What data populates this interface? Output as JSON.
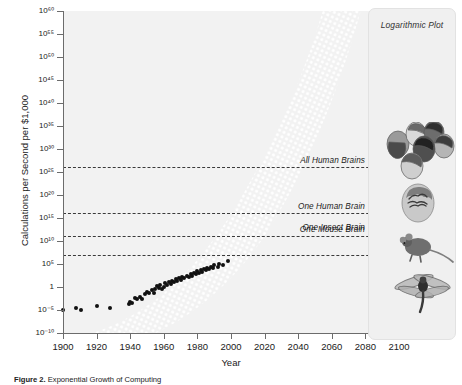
{
  "figure": {
    "panel_title": "Logarithmic Plot",
    "caption_prefix": "Figure 2.",
    "caption_text": " Exponential Growth of Computing",
    "background": "#ffffff",
    "plot_background": "#f2f2f2",
    "point_color": "#111111",
    "ref_line_color": "#3a3a3a"
  },
  "chart_data": {
    "type": "scatter",
    "title": "Logarithmic Plot",
    "xlabel": "Year",
    "ylabel": "Calculations per Second per $1,000",
    "xlim": [
      1900,
      2100
    ],
    "ylim": [
      -10,
      60
    ],
    "y_scale": "log10",
    "grid": false,
    "legend_position": "none",
    "xticks": [
      1900,
      1920,
      1940,
      1960,
      1980,
      2000,
      2020,
      2040,
      2060,
      2080,
      2100
    ],
    "xtick_labels": [
      "1900",
      "1920",
      "1940",
      "1960",
      "1980",
      "2000",
      "2020",
      "2040",
      "2060",
      "2080",
      "2100"
    ],
    "yticks": [
      -10,
      -5,
      0,
      5,
      10,
      15,
      20,
      25,
      30,
      35,
      40,
      45,
      50,
      55,
      60
    ],
    "ytick_labels": [
      "10⁻¹⁰",
      "10⁻⁵",
      "1",
      "10⁵",
      "10¹⁰",
      "10¹⁵",
      "10²⁰",
      "10²⁵",
      "10³⁰",
      "10³⁵",
      "10⁴⁰",
      "10⁴⁵",
      "10⁵⁰",
      "10⁵⁵",
      "10⁶⁰"
    ],
    "reference_lines": [
      {
        "label": "All Human Brains",
        "y_exp": 26,
        "icon": "human-heads-cluster"
      },
      {
        "label": "One Human Brain",
        "y_exp": 16,
        "icon": "human-head-brain"
      },
      {
        "label": "One Mouse Brain",
        "y_exp": 11,
        "icon": "mouse"
      },
      {
        "label": "One Insect Brain",
        "y_exp": 7,
        "icon": "dragonfly"
      }
    ],
    "series": [
      {
        "name": "Computing devices",
        "marker": "filled-circle",
        "color": "#111111",
        "points": [
          [
            1900,
            -5.0
          ],
          [
            1908,
            -4.5
          ],
          [
            1911,
            -4.9
          ],
          [
            1920,
            -4.1
          ],
          [
            1928,
            -4.6
          ],
          [
            1939,
            -3.6
          ],
          [
            1940,
            -3.2
          ],
          [
            1941,
            -3.4
          ],
          [
            1943,
            -2.3
          ],
          [
            1944,
            -2.7
          ],
          [
            1946,
            -2.1
          ],
          [
            1947,
            -2.6
          ],
          [
            1949,
            -1.6
          ],
          [
            1950,
            -1.1
          ],
          [
            1951,
            -1.4
          ],
          [
            1953,
            -0.7
          ],
          [
            1954,
            -1.2
          ],
          [
            1955,
            -0.4
          ],
          [
            1956,
            0.2
          ],
          [
            1957,
            -0.2
          ],
          [
            1958,
            0.5
          ],
          [
            1959,
            -0.5
          ],
          [
            1960,
            0.1
          ],
          [
            1961,
            0.8
          ],
          [
            1962,
            0.4
          ],
          [
            1963,
            1.1
          ],
          [
            1964,
            0.6
          ],
          [
            1965,
            1.4
          ],
          [
            1966,
            1.0
          ],
          [
            1967,
            1.7
          ],
          [
            1968,
            1.3
          ],
          [
            1969,
            2.0
          ],
          [
            1970,
            1.6
          ],
          [
            1971,
            2.2
          ],
          [
            1972,
            1.9
          ],
          [
            1974,
            2.5
          ],
          [
            1975,
            2.2
          ],
          [
            1976,
            2.8
          ],
          [
            1977,
            2.5
          ],
          [
            1978,
            3.1
          ],
          [
            1979,
            2.8
          ],
          [
            1980,
            3.4
          ],
          [
            1981,
            3.1
          ],
          [
            1982,
            3.6
          ],
          [
            1983,
            3.3
          ],
          [
            1984,
            3.9
          ],
          [
            1985,
            3.6
          ],
          [
            1986,
            4.2
          ],
          [
            1987,
            3.9
          ],
          [
            1988,
            4.4
          ],
          [
            1989,
            4.1
          ],
          [
            1990,
            4.7
          ],
          [
            1992,
            4.4
          ],
          [
            1993,
            5.0
          ],
          [
            1995,
            4.8
          ],
          [
            1998,
            5.6
          ]
        ]
      }
    ],
    "trend": {
      "name": "Exponential trend band",
      "style": "white-dotted-band",
      "color": "#ffffff",
      "from": [
        1900,
        -6.0
      ],
      "to": [
        2060,
        60.0
      ]
    }
  }
}
